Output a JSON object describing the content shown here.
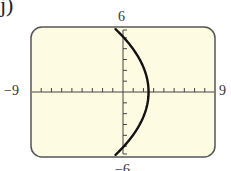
{
  "figure": {
    "part_label": "j)",
    "screen_bg": "#fdfbe2",
    "frame_color": "#555555",
    "curve_color": "#111111"
  },
  "chart_data": {
    "type": "line",
    "title": "",
    "window": {
      "xmin": -9,
      "xmax": 9,
      "ymin": -6,
      "ymax": 6,
      "xscl": 1,
      "yscl": 1
    },
    "tick_labels": {
      "xmin": "−9",
      "xmax": "9",
      "ymin": "−6",
      "ymax": "6"
    },
    "xlabel": "",
    "ylabel": "",
    "grid": false,
    "series": [
      {
        "name": "curve",
        "equation_estimate": "x = 2.5 - 0.096*y^2",
        "vertex": [
          2.5,
          0
        ],
        "points": [
          [
            -0.8,
            5.8
          ],
          [
            0,
            5.1
          ],
          [
            0.5,
            4.5
          ],
          [
            1.0,
            3.9
          ],
          [
            1.5,
            3.2
          ],
          [
            2.0,
            2.3
          ],
          [
            2.3,
            1.4
          ],
          [
            2.5,
            0
          ],
          [
            2.3,
            -1.4
          ],
          [
            2.0,
            -2.3
          ],
          [
            1.5,
            -3.2
          ],
          [
            1.0,
            -3.9
          ],
          [
            0.5,
            -4.5
          ],
          [
            0,
            -5.1
          ],
          [
            -0.8,
            -5.8
          ]
        ]
      }
    ]
  }
}
